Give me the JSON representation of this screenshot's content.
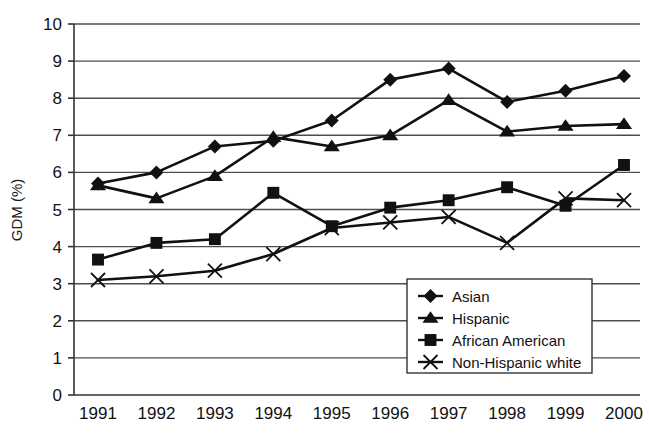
{
  "chart_data": {
    "type": "line",
    "title": "",
    "xlabel": "",
    "ylabel": "GDM (%)",
    "categories": [
      "1991",
      "1992",
      "1993",
      "1994",
      "1995",
      "1996",
      "1997",
      "1998",
      "1999",
      "2000"
    ],
    "x": [
      1991,
      1992,
      1993,
      1994,
      1995,
      1996,
      1997,
      1998,
      1999,
      2000
    ],
    "ylim": [
      0,
      10
    ],
    "xlim": [
      1991,
      2000
    ],
    "yticks": [
      0,
      1,
      2,
      3,
      4,
      5,
      6,
      7,
      8,
      9,
      10
    ],
    "grid": "horizontal",
    "legend_position": "bottom-right",
    "series": [
      {
        "name": "Asian",
        "marker": "diamond",
        "values": [
          5.7,
          6.0,
          6.7,
          6.85,
          7.4,
          8.5,
          8.8,
          7.9,
          8.2,
          8.6
        ]
      },
      {
        "name": "Hispanic",
        "marker": "triangle",
        "values": [
          5.65,
          5.3,
          5.9,
          6.95,
          6.7,
          7.0,
          7.95,
          7.1,
          7.25,
          7.3
        ]
      },
      {
        "name": "African American",
        "marker": "square",
        "values": [
          3.65,
          4.1,
          4.2,
          5.45,
          4.55,
          5.05,
          5.25,
          5.6,
          5.1,
          6.2
        ]
      },
      {
        "name": "Non-Hispanic white",
        "marker": "cross",
        "values": [
          3.1,
          3.2,
          3.35,
          3.8,
          4.5,
          4.65,
          4.8,
          4.1,
          5.3,
          5.25
        ]
      }
    ]
  },
  "axis": {
    "y_tick_labels": [
      "10",
      "9",
      "8",
      "7",
      "6",
      "5",
      "4",
      "3",
      "2",
      "1",
      "0"
    ],
    "x_tick_labels": [
      "1991",
      "1992",
      "1993",
      "1994",
      "1995",
      "1996",
      "1997",
      "1998",
      "1999",
      "2000"
    ],
    "y_title": "GDM (%)"
  },
  "legend": {
    "items": [
      {
        "label": "Asian",
        "marker": "diamond"
      },
      {
        "label": "Hispanic",
        "marker": "triangle"
      },
      {
        "label": "African American",
        "marker": "square"
      },
      {
        "label": "Non-Hispanic white",
        "marker": "cross"
      }
    ]
  },
  "colors": {
    "ink": "#111111",
    "grid": "#4d4d4d",
    "background": "#ffffff"
  }
}
